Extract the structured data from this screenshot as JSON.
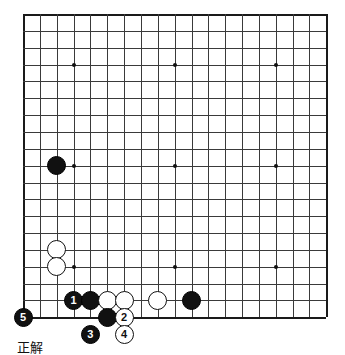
{
  "diagram": {
    "kind": "go-board-problem-diagram",
    "caption": "正解",
    "board": {
      "size": 19,
      "origin_x": 23,
      "origin_y": 14,
      "spacing": 16.85,
      "line_color": "#3a3a3a",
      "edge_color": "#1a1a1a",
      "background": "#ffffff",
      "star_points": [
        {
          "col": 3,
          "row": 3
        },
        {
          "col": 9,
          "row": 3
        },
        {
          "col": 15,
          "row": 3
        },
        {
          "col": 3,
          "row": 9
        },
        {
          "col": 9,
          "row": 9
        },
        {
          "col": 15,
          "row": 9
        },
        {
          "col": 3,
          "row": 15
        },
        {
          "col": 9,
          "row": 15
        },
        {
          "col": 15,
          "row": 15
        }
      ]
    },
    "stones": [
      {
        "color": "black",
        "col": 2,
        "row": 9,
        "label": "",
        "radius": 9.5,
        "name": "black-stone-upper-left"
      },
      {
        "color": "white",
        "col": 2,
        "row": 14,
        "label": "",
        "radius": 9.5,
        "name": "white-stone-a"
      },
      {
        "color": "white",
        "col": 2,
        "row": 15,
        "label": "",
        "radius": 9.5,
        "name": "white-stone-b"
      },
      {
        "color": "black",
        "col": 3,
        "row": 17,
        "label": "1",
        "radius": 9.5,
        "name": "black-stone-move-1"
      },
      {
        "color": "black",
        "col": 4,
        "row": 17,
        "label": "",
        "radius": 9.5,
        "name": "black-stone-c"
      },
      {
        "color": "white",
        "col": 5,
        "row": 17,
        "label": "",
        "radius": 9.5,
        "name": "white-stone-d"
      },
      {
        "color": "white",
        "col": 6,
        "row": 17,
        "label": "",
        "radius": 9.5,
        "name": "white-stone-e"
      },
      {
        "color": "white",
        "col": 8,
        "row": 17,
        "label": "",
        "radius": 9.5,
        "name": "white-stone-f"
      },
      {
        "color": "black",
        "col": 10,
        "row": 17,
        "label": "",
        "radius": 9.5,
        "name": "black-stone-g"
      },
      {
        "color": "black",
        "col": 0,
        "row": 18,
        "label": "5",
        "radius": 9.5,
        "name": "black-stone-move-5"
      },
      {
        "color": "black",
        "col": 5,
        "row": 18,
        "label": "",
        "radius": 9.5,
        "name": "black-stone-h"
      },
      {
        "color": "white",
        "col": 6,
        "row": 18,
        "label": "2",
        "radius": 9.5,
        "name": "white-stone-move-2"
      },
      {
        "color": "black",
        "col": 4,
        "row": 19,
        "label": "3",
        "radius": 9.5,
        "name": "black-stone-move-3"
      },
      {
        "color": "white",
        "col": 6,
        "row": 19,
        "label": "4",
        "radius": 9.5,
        "name": "white-stone-move-4"
      }
    ],
    "caption_pos": {
      "x": 17,
      "y": 337
    }
  }
}
